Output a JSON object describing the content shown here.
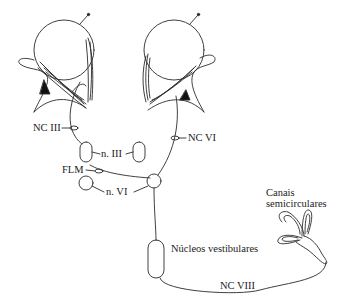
{
  "diagram": {
    "labels": {
      "nc_iii": "NC III",
      "nc_vi": "NC VI",
      "n_iii": "n. III",
      "flm": "FLM",
      "n_vi": "n. VI",
      "canais_line1": "Canais",
      "canais_line2": "semicirculares",
      "nucleos": "Núcleos vestibulares",
      "nc_viii": "NC VIII"
    },
    "colors": {
      "stroke": "#2a2a2a",
      "background": "#ffffff"
    }
  }
}
